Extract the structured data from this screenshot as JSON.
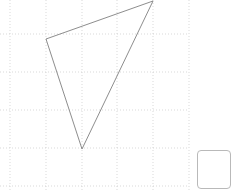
{
  "figure": {
    "name": "triangle-on-dotted-grid",
    "width": 234,
    "height": 192,
    "background_color": "#ffffff",
    "grid": {
      "style": "dotted",
      "color": "#c8c8c8",
      "stroke_width": 0.7,
      "dash": "1 2",
      "x_lines": [
        10,
        46,
        82,
        117,
        153,
        189
      ],
      "y_lines": [
        34,
        72,
        110,
        148,
        186
      ],
      "cell_width": 36,
      "cell_height": 38
    },
    "shape": {
      "type": "triangle",
      "stroke_color": "#808080",
      "stroke_width": 0.9,
      "fill": "none",
      "vertices": [
        {
          "label": "left",
          "x": 46,
          "y": 39
        },
        {
          "label": "top-right",
          "x": 153,
          "y": 1
        },
        {
          "label": "bottom",
          "x": 82,
          "y": 149
        }
      ],
      "points_attr": "46,39 153,1 82,149"
    }
  },
  "answer": {
    "value": "",
    "placeholder": ""
  }
}
